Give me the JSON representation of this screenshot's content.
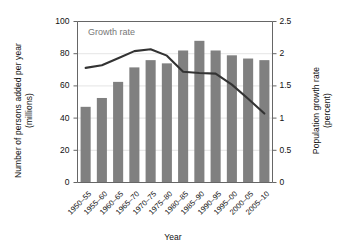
{
  "chart_data": {
    "type": "bar",
    "title": "",
    "xlabel": "Year",
    "ylabel": "Number of persons added per year (millions)",
    "ylabel_line1": "Number of persons added per year",
    "ylabel_line2": "(millions)",
    "y2label": "Population growth rate (percent)",
    "y2label_line1": "Population growth rate",
    "y2label_line2": "(percent)",
    "categories": [
      "1950–55",
      "1955–60",
      "1960–65",
      "1965–70",
      "1970–75",
      "1975–80",
      "1980–85",
      "1985–90",
      "1990–95",
      "1995–00",
      "2000–05",
      "2005–10"
    ],
    "ylim": [
      0,
      100
    ],
    "yticks": [
      0,
      20,
      40,
      60,
      80,
      100
    ],
    "ytick_labels": [
      "0",
      "20",
      "40",
      "60",
      "80",
      "100"
    ],
    "y2lim": [
      0,
      2.5
    ],
    "y2ticks": [
      0,
      0.5,
      1,
      1.5,
      2,
      2.5
    ],
    "y2tick_labels": [
      "0",
      "0.5",
      "1",
      "1.5",
      "2",
      "2.5"
    ],
    "grid": true,
    "legend": "none",
    "series": [
      {
        "name": "Number of persons added per year",
        "type": "bar",
        "axis": "left",
        "unit": "millions",
        "color": "#808080",
        "values": [
          47,
          52.5,
          62.5,
          71.5,
          76,
          74,
          82,
          88,
          82,
          79,
          77,
          76
        ]
      },
      {
        "name": "Growth rate",
        "type": "line",
        "axis": "right",
        "unit": "percent",
        "color": "#333333",
        "values": [
          1.78,
          1.82,
          1.93,
          2.04,
          2.07,
          1.97,
          1.72,
          1.7,
          1.69,
          1.52,
          1.3,
          1.07
        ]
      }
    ],
    "annotations": [
      {
        "text": "Growth rate",
        "color": "#777777"
      }
    ]
  },
  "style": {
    "bar_color": "#808080",
    "line_color": "#333333",
    "annotation_color": "#777777",
    "axis_color": "#666666",
    "grid_color": "#dddddd",
    "background": "#ffffff"
  }
}
